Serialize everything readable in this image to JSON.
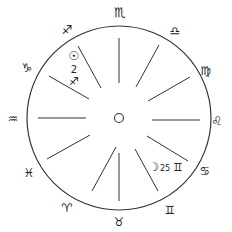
{
  "chart": {
    "center": [
      119,
      118
    ],
    "radius": 92,
    "stroke_color": "#333333",
    "signs": [
      {
        "name": "scorpio",
        "glyph": "♏",
        "x": 120,
        "y": 12
      },
      {
        "name": "libra",
        "glyph": "♎",
        "x": 175,
        "y": 30
      },
      {
        "name": "virgo",
        "glyph": "♍",
        "x": 206,
        "y": 70
      },
      {
        "name": "leo",
        "glyph": "♌",
        "x": 217,
        "y": 120
      },
      {
        "name": "cancer",
        "glyph": "♋",
        "x": 205,
        "y": 170
      },
      {
        "name": "gemini",
        "glyph": "♊",
        "x": 170,
        "y": 210
      },
      {
        "name": "taurus",
        "glyph": "♉",
        "x": 119,
        "y": 223
      },
      {
        "name": "aries",
        "glyph": "♈",
        "x": 67,
        "y": 208
      },
      {
        "name": "pisces",
        "glyph": "♓",
        "x": 29,
        "y": 173
      },
      {
        "name": "aquarius",
        "glyph": "♒",
        "x": 13,
        "y": 119
      },
      {
        "name": "capricorn",
        "glyph": "♑",
        "x": 27,
        "y": 68
      },
      {
        "name": "sagittarius",
        "glyph": "♐",
        "x": 67,
        "y": 30
      }
    ],
    "planets": [
      {
        "name": "sun",
        "glyph": "☉",
        "x": 74,
        "y": 56,
        "degree": "2",
        "degree_x": 74,
        "degree_y": 69,
        "sign_glyph": "♐",
        "sign_x": 74,
        "sign_y": 81
      },
      {
        "name": "moon",
        "glyph": "☽",
        "x": 154,
        "y": 167,
        "degree": "25",
        "degree_x": 165,
        "degree_y": 168,
        "sign_glyph": "♊",
        "sign_x": 178,
        "sign_y": 167
      }
    ],
    "center_marker": "○"
  }
}
